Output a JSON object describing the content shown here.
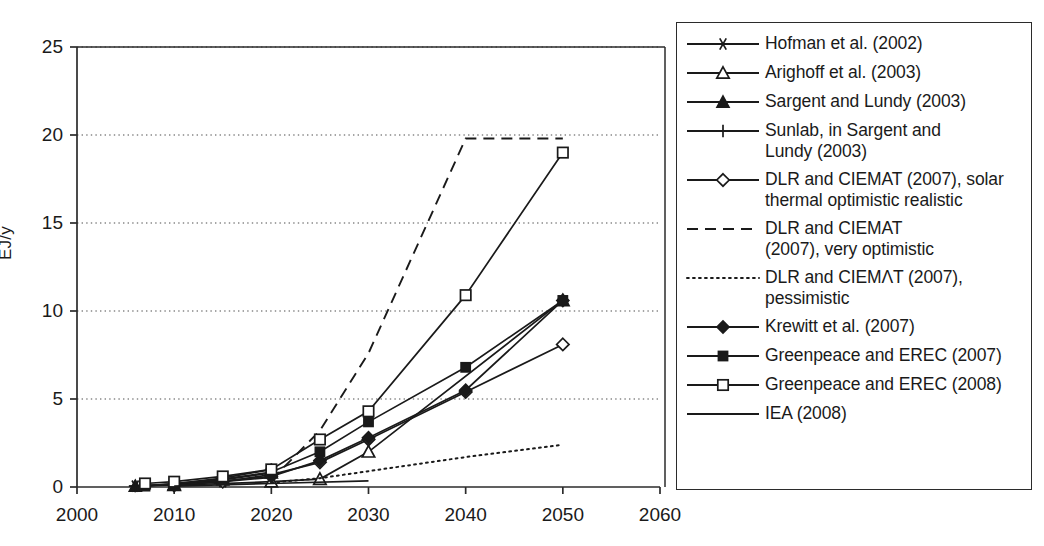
{
  "chart_data": {
    "type": "line",
    "title": "",
    "xlabel": "",
    "ylabel": "EJ/y",
    "xlim": [
      2000,
      2060
    ],
    "ylim": [
      0,
      25
    ],
    "xticks": [
      2000,
      2010,
      2020,
      2030,
      2040,
      2050,
      2060
    ],
    "yticks": [
      0,
      5,
      10,
      15,
      20,
      25
    ],
    "grid": "horizontal-dotted",
    "legend_position": "right-outside",
    "series": [
      {
        "name": "Hofman et al. (2002)",
        "marker": "asterisk",
        "line": "solid",
        "x": [
          2006,
          2010,
          2015,
          2020
        ],
        "y": [
          0.05,
          0.12,
          0.3,
          0.55
        ]
      },
      {
        "name": "Arighoff et al. (2003)",
        "marker": "open-triangle",
        "line": "solid",
        "x": [
          2010,
          2020,
          2025,
          2030,
          2050
        ],
        "y": [
          0.1,
          0.3,
          0.45,
          2.0,
          10.6
        ]
      },
      {
        "name": "Sargent and Lundy (2003)",
        "marker": "filled-triangle",
        "line": "solid",
        "x": [
          2006,
          2010,
          2015,
          2020
        ],
        "y": [
          0.05,
          0.15,
          0.4,
          0.8
        ]
      },
      {
        "name": "Sunlab, in Sargent and Lundy (2003)",
        "marker": "plus",
        "line": "solid",
        "x": [
          2006,
          2010,
          2015,
          2020
        ],
        "y": [
          0.05,
          0.18,
          0.5,
          1.0
        ]
      },
      {
        "name": "DLR and CIEMAT (2007), solar thermal optimistic realistic",
        "marker": "open-diamond",
        "line": "solid",
        "x": [
          2010,
          2015,
          2020,
          2025,
          2030,
          2040,
          2050
        ],
        "y": [
          0.1,
          0.3,
          0.7,
          1.4,
          2.7,
          5.4,
          8.1
        ]
      },
      {
        "name": "DLR and CIEMAT (2007), very optimistic",
        "marker": "none",
        "line": "dashed",
        "x": [
          2020,
          2025,
          2030,
          2040,
          2050
        ],
        "y": [
          0.4,
          3.2,
          7.6,
          19.8,
          19.8
        ]
      },
      {
        "name": "DLR and CIEMAT (2007), pessimistic",
        "marker": "none",
        "line": "dotted",
        "x": [
          2020,
          2025,
          2030,
          2040,
          2050
        ],
        "y": [
          0.25,
          0.5,
          0.9,
          1.7,
          2.4
        ]
      },
      {
        "name": "Krewitt et al. (2007)",
        "marker": "filled-diamond",
        "line": "solid",
        "x": [
          2010,
          2020,
          2025,
          2030,
          2040,
          2050
        ],
        "y": [
          0.1,
          0.6,
          1.5,
          2.8,
          5.5,
          10.6
        ]
      },
      {
        "name": "Greenpeace and EREC (2007)",
        "marker": "filled-square",
        "line": "solid",
        "x": [
          2007,
          2010,
          2015,
          2020,
          2025,
          2030,
          2040,
          2050
        ],
        "y": [
          0.05,
          0.2,
          0.45,
          0.85,
          2.0,
          3.7,
          6.8,
          10.6
        ]
      },
      {
        "name": "Greenpeace and EREC (2008)",
        "marker": "open-square",
        "line": "solid",
        "x": [
          2007,
          2010,
          2015,
          2020,
          2025,
          2030,
          2040,
          2050
        ],
        "y": [
          0.2,
          0.3,
          0.6,
          1.0,
          2.7,
          4.3,
          10.9,
          19.0
        ]
      },
      {
        "name": "IEA (2008)",
        "marker": "none",
        "line": "solid",
        "x": [
          2010,
          2020,
          2030
        ],
        "y": [
          0.05,
          0.2,
          0.35
        ]
      }
    ]
  },
  "axes": {
    "y_label": "EJ/y",
    "y_tick_labels": [
      "25",
      "20",
      "15",
      "10",
      "5",
      "0"
    ],
    "x_tick_labels": [
      "2000",
      "2010",
      "2020",
      "2030",
      "2040",
      "2050",
      "2060"
    ]
  },
  "legend": {
    "items": [
      {
        "label": "Hofman et al. (2002)",
        "marker": "asterisk",
        "line": "solid"
      },
      {
        "label": "Arighoff et al. (2003)",
        "marker": "open-triangle",
        "line": "solid"
      },
      {
        "label": "Sargent and Lundy (2003)",
        "marker": "filled-triangle",
        "line": "solid"
      },
      {
        "label": "Sunlab, in Sargent and\nLundy (2003)",
        "marker": "plus",
        "line": "solid"
      },
      {
        "label": "DLR and CIEMAT (2007), solar\nthermal optimistic realistic",
        "marker": "open-diamond",
        "line": "solid"
      },
      {
        "label": "DLR and CIEMAT\n(2007), very optimistic",
        "marker": "none",
        "line": "dashed"
      },
      {
        "label": "DLR and CIEMΛT (2007),\npessimistic",
        "marker": "none",
        "line": "dotted"
      },
      {
        "label": "Krewitt et al. (2007)",
        "marker": "filled-diamond",
        "line": "solid"
      },
      {
        "label": "Greenpeace and EREC (2007)",
        "marker": "filled-square",
        "line": "solid"
      },
      {
        "label": "Greenpeace and EREC (2008)",
        "marker": "open-square",
        "line": "solid"
      },
      {
        "label": "IEA (2008)",
        "marker": "none",
        "line": "solid"
      }
    ]
  },
  "colors": {
    "ink": "#1a1a1a",
    "axis": "#2b2b2b",
    "grid": "#4d4d4d",
    "background": "#ffffff"
  }
}
